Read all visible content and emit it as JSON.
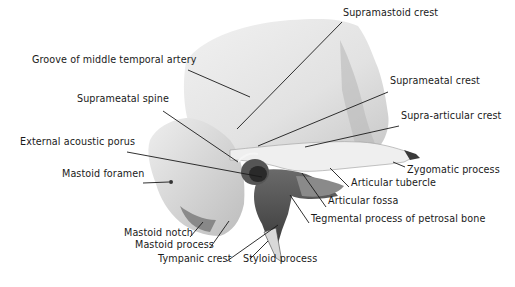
{
  "figure": {
    "labels": [
      {
        "id": "supramastoid-crest",
        "text": "Supramastoid crest",
        "x": 343,
        "y": 16
      },
      {
        "id": "groove-middle-temporal-artery",
        "text": "Groove of middle temporal artery",
        "x": 32,
        "y": 63
      },
      {
        "id": "suprameatal-crest",
        "text": "Suprameatal crest",
        "x": 390,
        "y": 84
      },
      {
        "id": "suprameatal-spine",
        "text": "Suprameatal spine",
        "x": 77,
        "y": 102
      },
      {
        "id": "supra-articular-crest",
        "text": "Supra-articular crest",
        "x": 401,
        "y": 119
      },
      {
        "id": "external-acoustic-porus",
        "text": "External acoustic porus",
        "x": 20,
        "y": 145
      },
      {
        "id": "zygomatic-process",
        "text": "Zygomatic process",
        "x": 407,
        "y": 173
      },
      {
        "id": "mastoid-foramen",
        "text": "Mastoid foramen",
        "x": 62,
        "y": 177
      },
      {
        "id": "articular-tubercle",
        "text": "Articular tubercle",
        "x": 351,
        "y": 186
      },
      {
        "id": "articular-fossa",
        "text": "Articular fossa",
        "x": 328,
        "y": 204
      },
      {
        "id": "tegmental-process",
        "text": "Tegmental process of petrosal bone",
        "x": 311,
        "y": 222
      },
      {
        "id": "mastoid-notch",
        "text": "Mastoid notch",
        "x": 124,
        "y": 236
      },
      {
        "id": "mastoid-process",
        "text": "Mastoid process",
        "x": 135,
        "y": 248
      },
      {
        "id": "tympanic-crest",
        "text": "Tympanic crest",
        "x": 158,
        "y": 262
      },
      {
        "id": "styloid-process",
        "text": "Styloid process",
        "x": 243,
        "y": 262
      }
    ],
    "leaders": [
      {
        "id": "supramastoid-crest",
        "x1": 342,
        "y1": 22,
        "x2": 237,
        "y2": 129
      },
      {
        "id": "groove-middle-temporal-artery",
        "x1": 188,
        "y1": 70,
        "x2": 250,
        "y2": 97
      },
      {
        "id": "suprameatal-crest",
        "x1": 388,
        "y1": 92,
        "x2": 258,
        "y2": 146
      },
      {
        "id": "suprameatal-spine",
        "x1": 163,
        "y1": 111,
        "x2": 238,
        "y2": 162
      },
      {
        "id": "supra-articular-crest",
        "x1": 399,
        "y1": 126,
        "x2": 305,
        "y2": 147
      },
      {
        "id": "external-acoustic-porus",
        "x1": 127,
        "y1": 152,
        "x2": 262,
        "y2": 177
      },
      {
        "id": "zygomatic-process",
        "x1": 405,
        "y1": 167,
        "x2": 393,
        "y2": 162
      },
      {
        "id": "mastoid-foramen",
        "x1": 143,
        "y1": 183,
        "x2": 169,
        "y2": 182
      },
      {
        "id": "articular-tubercle",
        "x1": 349,
        "y1": 187,
        "x2": 330,
        "y2": 168
      },
      {
        "id": "articular-fossa",
        "x1": 326,
        "y1": 207,
        "x2": 302,
        "y2": 173
      },
      {
        "id": "tegmental-process",
        "x1": 309,
        "y1": 223,
        "x2": 290,
        "y2": 195
      },
      {
        "id": "mastoid-notch",
        "x1": 190,
        "y1": 237,
        "x2": 203,
        "y2": 222
      },
      {
        "id": "mastoid-process",
        "x1": 210,
        "y1": 248,
        "x2": 229,
        "y2": 221
      },
      {
        "id": "tympanic-crest",
        "x1": 227,
        "y1": 261,
        "x2": 278,
        "y2": 225
      },
      {
        "id": "styloid-process",
        "x1": 250,
        "y1": 259,
        "x2": 268,
        "y2": 241
      }
    ]
  }
}
